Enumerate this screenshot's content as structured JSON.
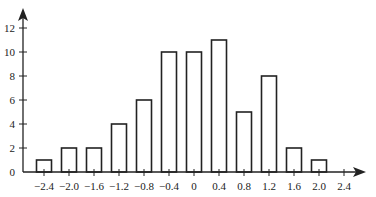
{
  "chart_data": {
    "type": "bar",
    "title": "",
    "xlabel": "",
    "ylabel": "",
    "categories": [
      -2.4,
      -2.0,
      -1.6,
      -1.2,
      -0.8,
      -0.4,
      0,
      0.4,
      0.8,
      1.2,
      1.6,
      2.0
    ],
    "values": [
      1,
      2,
      2,
      4,
      6,
      10,
      10,
      11,
      5,
      8,
      2,
      1
    ],
    "x_ticks": [
      "-2.4",
      "-2.0",
      "-1.6",
      "-1.2",
      "-0.8",
      "-0.4",
      "0",
      "0.4",
      "0.8",
      "1.2",
      "1.6",
      "2.0",
      "2.4"
    ],
    "y_ticks": [
      "0",
      "2",
      "4",
      "6",
      "8",
      "10",
      "12"
    ],
    "xlim": [
      -2.8,
      2.8
    ],
    "ylim": [
      0,
      12
    ],
    "grid": false,
    "legend": null
  }
}
